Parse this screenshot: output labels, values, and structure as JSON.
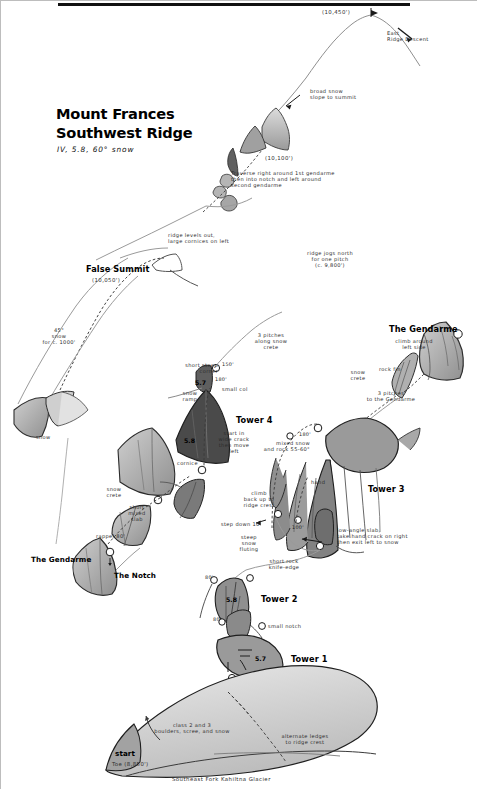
{
  "title": {
    "line1": "Mount Frances",
    "line2": "Southwest Ridge",
    "grade_line": "IV, 5.8, 60° snow"
  },
  "caption": "Southeast Fork Kahiltna Glacier",
  "summit": {
    "elevation": "(10,450')",
    "descent_label": "East\nRidge Descent",
    "approach_note": "broad snow\nslope to summit"
  },
  "gendarme_upper": {
    "elevation": "(10,100')",
    "note": "Traverse right around 1st gendarme\nthen into notch and left around\nsecond gendarme"
  },
  "false_summit": {
    "label": "False Summit",
    "elevation": "(10,050')",
    "ridge_note": "ridge levels out,\nlarge cornices on left",
    "snow_note": "45°\nsnow\nfor c. 1000'"
  },
  "ridge_jog": {
    "note": "ridge jogs north\nfor one pitch\n(c. 9,800')"
  },
  "gendarme_right": {
    "label": "The Gendarme",
    "note": "climb around\nleft side",
    "rock_fin": "rock fin",
    "pitches": "3 pitches\nto the Gendarme",
    "snow_crete": "snow\ncrete"
  },
  "gendarme_left": {
    "label": "The Gendarme",
    "notch_label": "The Notch",
    "rappel": "rappel 80'",
    "mixed_slab": "short\nmixed\nslab",
    "snow_crete": "snow\ncrete"
  },
  "left_snow": {
    "label": "snow"
  },
  "tower4": {
    "label": "Tower 4",
    "pitches_note": "3 pitches\nalong snow\ncrete",
    "corner_note": "short steep\ncorner",
    "corner_grade": "5.7",
    "col_note": "small col",
    "ramp_note": "snow\nramp",
    "start_grade": "5.8",
    "start_note": "start in\nwide crack\nthen move\nleft",
    "cornice": "cornice",
    "belay_150": "150'",
    "belay_180": "180'"
  },
  "tower3": {
    "label": "Tower 3",
    "mixed_note": "mixed snow\nand rock 55-60°",
    "hand_note": "hand",
    "climb_note": "climb\nback up to\nridge crest",
    "step_note": "step down 10'",
    "fluting_note": "steep\nsnow\nfluting",
    "slab_note": "low-angle slab,\ntake hand crack on right\nthen exit left to snow",
    "belay_180": "180'",
    "belay_100": "100'"
  },
  "tower2": {
    "label": "Tower 2",
    "grade": "5.8",
    "knife_note": "short rock\nknife-edge",
    "belay_80": "80'"
  },
  "tower1": {
    "label": "Tower 1",
    "grade": "5.7",
    "notch_note": "small notch",
    "belay_80": "80'"
  },
  "approach": {
    "start_label": "start",
    "toe_elevation": "Toe (8,850')",
    "terrain_note": "class 2 and 3\nboulders, scree, and snow",
    "alternate_note": "alternate ledges\nto ridge crest"
  },
  "colors": {
    "rock_dark": "#8e8e8e",
    "rock_mid": "#a8a8a8",
    "rock_light": "#c4c4c4",
    "ink": "#1a1a1a",
    "snow_line": "#9a9a9a"
  }
}
